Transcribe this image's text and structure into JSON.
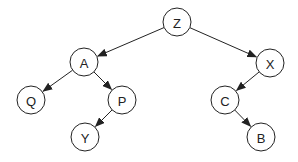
{
  "diagram": {
    "type": "binary-tree",
    "nodes": [
      {
        "id": "Z",
        "label": "Z",
        "x": 177,
        "y": 22
      },
      {
        "id": "A",
        "label": "A",
        "x": 84,
        "y": 62
      },
      {
        "id": "X",
        "label": "X",
        "x": 270,
        "y": 63
      },
      {
        "id": "Q",
        "label": "Q",
        "x": 31,
        "y": 100
      },
      {
        "id": "P",
        "label": "P",
        "x": 122,
        "y": 100
      },
      {
        "id": "C",
        "label": "C",
        "x": 225,
        "y": 100
      },
      {
        "id": "Y",
        "label": "Y",
        "x": 85,
        "y": 137
      },
      {
        "id": "B",
        "label": "B",
        "x": 261,
        "y": 137
      }
    ],
    "edges": [
      {
        "from": "Z",
        "to": "A"
      },
      {
        "from": "Z",
        "to": "X"
      },
      {
        "from": "A",
        "to": "Q"
      },
      {
        "from": "A",
        "to": "P"
      },
      {
        "from": "P",
        "to": "Y"
      },
      {
        "from": "X",
        "to": "C"
      },
      {
        "from": "C",
        "to": "B"
      }
    ],
    "node_radius": 14,
    "stroke_color": "#222222",
    "fill_color": "#ffffff"
  }
}
